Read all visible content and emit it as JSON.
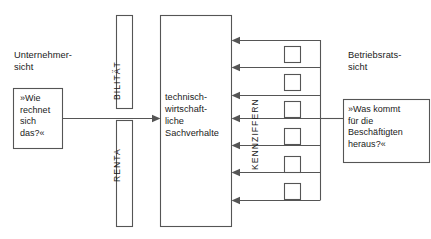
{
  "diagram": {
    "title_text": "",
    "stroke_color": "#555555",
    "text_color": "#1a1a1a",
    "background": "#ffffff"
  },
  "left_side": {
    "caption": "Unternehmer-\nsicht",
    "quote": "»Wie\nrechnet\nsich\ndas?«"
  },
  "right_side": {
    "caption": "Betriebsrats-\nsicht",
    "quote": "»Was kommt\nfür die\nBeschäftigten\nheraus?«"
  },
  "center": {
    "label": "technisch-\nwirtschaft-\nliche\nSachverhalte"
  },
  "axis_labels": {
    "renta": "RENTA",
    "bilitat": "BILITÄT",
    "kennziffern": "KENNZIFFERN"
  },
  "structure": {
    "arrow_count": 7,
    "indicator_box_count": 6,
    "arrow_rows_y": [
      40,
      67,
      95,
      118,
      145,
      172,
      200
    ],
    "indicator_boxes_y": [
      48,
      76,
      104,
      131,
      159,
      186
    ]
  }
}
